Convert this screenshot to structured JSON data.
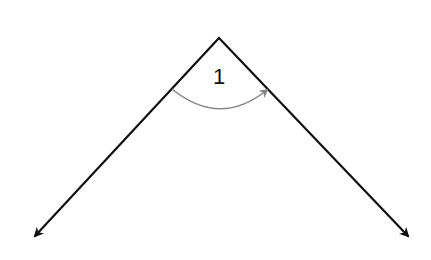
{
  "diagram": {
    "type": "angle",
    "angle_label": "1",
    "vertex": {
      "x": 219,
      "y": 38
    },
    "left_ray_end": {
      "x": 33,
      "y": 238
    },
    "right_ray_end": {
      "x": 410,
      "y": 238
    },
    "arc": {
      "start": {
        "x": 172,
        "y": 89
      },
      "end": {
        "x": 268,
        "y": 89
      },
      "direction": "left-to-right"
    },
    "colors": {
      "rays": "#111111",
      "arc": "#888888",
      "background": "#ffffff"
    }
  }
}
